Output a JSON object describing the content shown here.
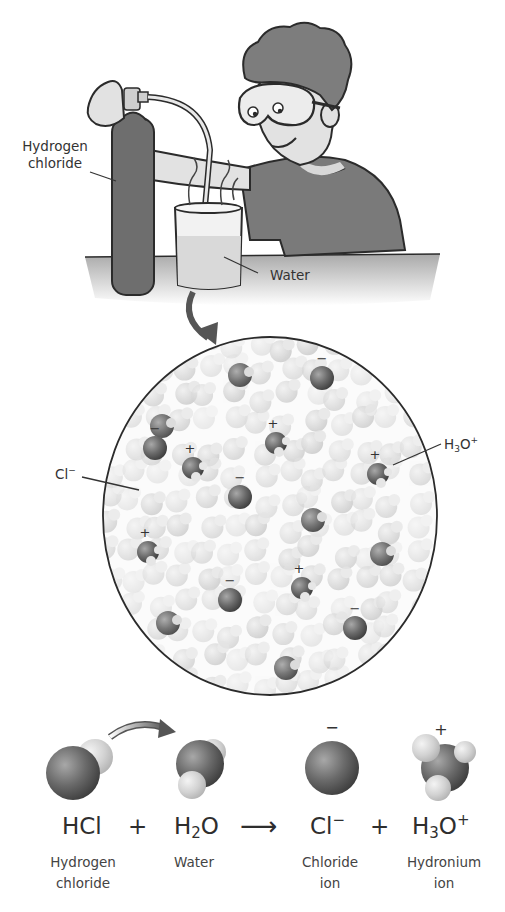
{
  "scene": {
    "labels": {
      "cylinder_line1": "Hydrogen",
      "cylinder_line2": "chloride",
      "beaker": "Water"
    }
  },
  "magnified_view": {
    "labels": {
      "chloride": {
        "base": "Cl",
        "sup": "−"
      },
      "hydronium": {
        "base": "H",
        "sub": "3",
        "mid": "O",
        "sup": "+"
      }
    },
    "chloride_ions": [
      [
        155,
        448
      ],
      [
        322,
        378
      ],
      [
        240,
        497
      ],
      [
        230,
        600
      ],
      [
        355,
        628
      ]
    ],
    "hydronium_ions": [
      [
        193,
        468
      ],
      [
        276,
        443
      ],
      [
        378,
        474
      ],
      [
        148,
        552
      ],
      [
        302,
        588
      ]
    ],
    "neutral_dark": [
      [
        240,
        375
      ],
      [
        162,
        426
      ],
      [
        313,
        520
      ],
      [
        382,
        554
      ],
      [
        168,
        623
      ],
      [
        286,
        668
      ]
    ]
  },
  "equation": {
    "reactant1": {
      "formula": "HCl",
      "name_line1": "Hydrogen",
      "name_line2": "chloride"
    },
    "plus1": "+",
    "reactant2": {
      "formula_base": "H",
      "formula_sub": "2",
      "formula_tail": "O",
      "name_line1": "Water"
    },
    "arrow": "⟶",
    "product1": {
      "formula_base": "Cl",
      "formula_sup": "−",
      "name_line1": "Chloride",
      "name_line2": "ion",
      "charge": "−"
    },
    "plus2": "+",
    "product2": {
      "formula_base": "H",
      "formula_sub": "3",
      "formula_mid": "O",
      "formula_sup": "+",
      "name_line1": "Hydronium",
      "name_line2": "ion",
      "charge": "+"
    }
  },
  "colors": {
    "outline": "#2b2b2b",
    "cylinder": "#6e6e6e",
    "shirt": "#7a7a7a",
    "hair": "#7d7d7d",
    "skin": "#e2e2e2",
    "table": "#b5b5b5",
    "water": "#d9d9d9",
    "ion": "#6a6a6a",
    "water_molecule": "#cfcfcf"
  }
}
